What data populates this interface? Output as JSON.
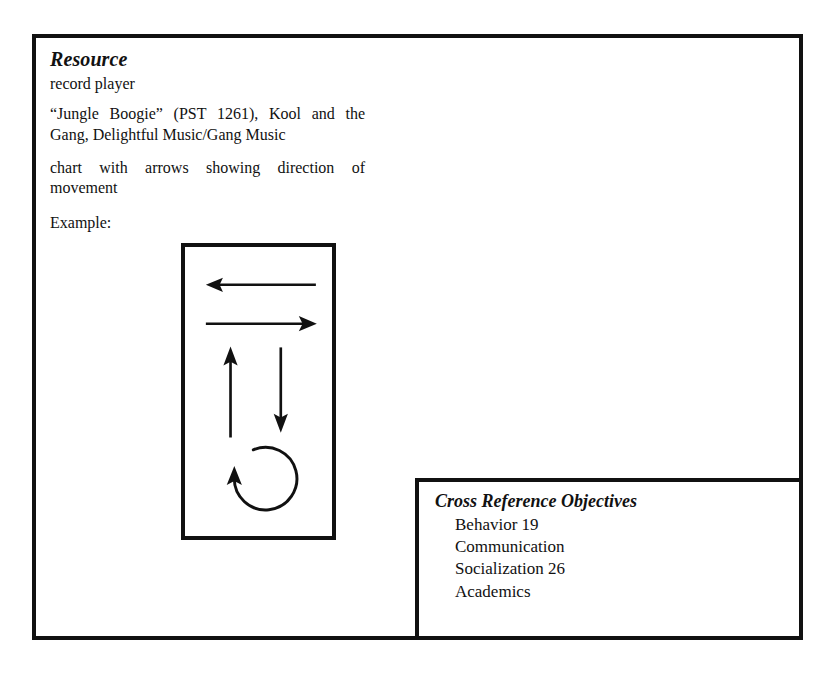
{
  "document": {
    "resource": {
      "heading": "Resource",
      "equipment": "record player",
      "media_citation": "“Jungle Boogie” (PST 1261), Kool and the Gang, Delightful Music/Gang Music",
      "materials": "chart with arrows showing direction of movement",
      "example_label": "Example:"
    },
    "diagram": {
      "name": "movement-direction-chart",
      "description": "chart with arrows showing direction of movement",
      "arrows": [
        {
          "id": "arrow-left",
          "direction": "left",
          "label": "left arrow"
        },
        {
          "id": "arrow-right",
          "direction": "right",
          "label": "right arrow"
        },
        {
          "id": "arrow-up",
          "direction": "up",
          "label": "up arrow"
        },
        {
          "id": "arrow-down",
          "direction": "down",
          "label": "down arrow"
        },
        {
          "id": "arrow-circle",
          "direction": "circular",
          "label": "turn around / circle arrow"
        }
      ]
    },
    "cross_reference": {
      "heading": "Cross Reference Objectives",
      "items": [
        "Behavior 19",
        "Communication",
        "Socialization 26",
        "Academics"
      ]
    }
  },
  "style": {
    "ink": "#111111",
    "paper": "#ffffff"
  }
}
